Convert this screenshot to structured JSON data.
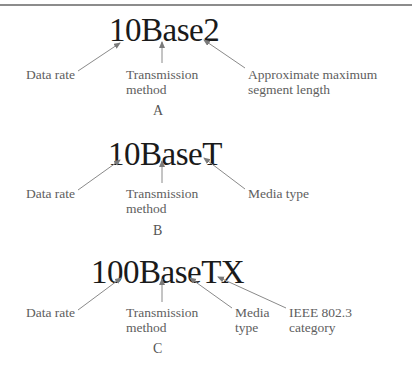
{
  "diagrams": [
    {
      "id": "A",
      "code": "10Base2",
      "labels": {
        "data_rate": "Data rate",
        "transmission": "Transmission\nmethod",
        "third": "Approximate maximum\nsegment length"
      },
      "caption": "A"
    },
    {
      "id": "B",
      "code": "10BaseT",
      "labels": {
        "data_rate": "Data rate",
        "transmission": "Transmission\nmethod",
        "third": "Media type"
      },
      "caption": "B"
    },
    {
      "id": "C",
      "code": "100BaseTX",
      "labels": {
        "data_rate": "Data rate",
        "transmission": "Transmission\nmethod",
        "media": "Media\ntype",
        "ieee": "IEEE 802.3\ncategory"
      },
      "caption": "C"
    }
  ],
  "colors": {
    "arrow": "#7a7a7a",
    "code_text": "#1a1a1a",
    "label_text": "#5e5e5e"
  }
}
